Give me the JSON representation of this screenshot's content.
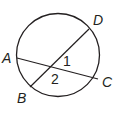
{
  "diagram": {
    "type": "circle-with-intersecting-chords",
    "stroke_color": "#231f20",
    "points": {
      "A": "A",
      "B": "B",
      "C": "C",
      "D": "D"
    },
    "angles": {
      "angle1": "1",
      "angle2": "2"
    },
    "chords": [
      "AC",
      "BD"
    ]
  }
}
